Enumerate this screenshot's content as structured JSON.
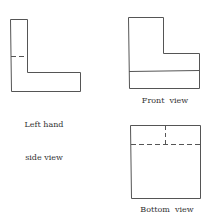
{
  "diagram": {
    "line_color": "#444444",
    "views": [
      {
        "id": "left",
        "label_line1": "Left hand",
        "label_line2": "side view"
      },
      {
        "id": "front",
        "label": "Front  view"
      },
      {
        "id": "bottom",
        "label": "Bottom  view"
      }
    ]
  }
}
